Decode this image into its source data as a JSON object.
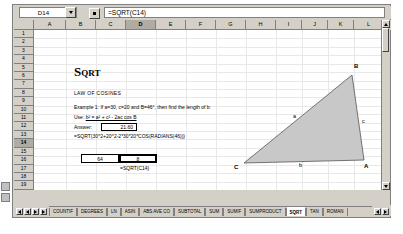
{
  "formula_bar": {
    "name_box_value": "D14",
    "formula": "=SQRT(C14)",
    "dropdown_icon": "chevron-down-icon",
    "function_icon": "function-button"
  },
  "grid": {
    "columns": [
      "A",
      "B",
      "C",
      "D",
      "E",
      "F",
      "G",
      "H",
      "I",
      "J",
      "K",
      "L"
    ],
    "selected_column": "D",
    "rows": [
      "1",
      "2",
      "3",
      "4",
      "5",
      "6",
      "7",
      "8",
      "9",
      "10",
      "11",
      "12",
      "13",
      "14",
      "15",
      "16",
      "17",
      "18",
      "19"
    ],
    "selected_row": "14"
  },
  "document": {
    "title_first": "S",
    "title_rest": "QRT",
    "subtitle": "LAW OF COSINES",
    "example": "Example 1: If a=30, c=20 and B=46°, then find the length of b:",
    "use_prefix": "Use: ",
    "use_formula": "b² = a² + c² - 2ac cos B",
    "answer_label": "Answer:",
    "answer_value": "21.60",
    "big_formula": "=SQRT(30^2+20^2-2*30*20*COS(RADIANS(46)))",
    "cell_left_value": "64",
    "cell_right_value": "8",
    "cell_note": "=SQRT(C14)"
  },
  "figure": {
    "vertex_b": "B",
    "vertex_c": "C",
    "vertex_a": "A",
    "side_a": "a",
    "side_b": "b",
    "side_c": "c",
    "fill_color": "#c8c8c8"
  },
  "sheet_tabs": {
    "items": [
      "COUNTIF",
      "DEGREES",
      "LN",
      "ASIN",
      "ABS AVE CO",
      "SUBTOTAL",
      "SUM",
      "SUMIF",
      "SUMPRODUCT",
      "SQRT",
      "TAN",
      "ROMAN"
    ],
    "active": "SQRT",
    "nav_first_icon": "nav-first-icon",
    "nav_prev_icon": "nav-prev-icon",
    "nav_next_icon": "nav-next-icon",
    "nav_last_icon": "nav-last-icon"
  },
  "scrollbars": {
    "up_icon": "scroll-up-icon",
    "down_icon": "scroll-down-icon",
    "left_icon": "scroll-left-icon",
    "right_icon": "scroll-right-icon"
  }
}
